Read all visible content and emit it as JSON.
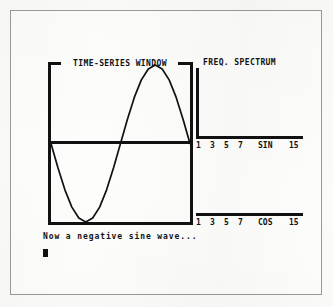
{
  "app": {
    "screen_title": "TIME-SERIES WINDOW",
    "spectrum_title": "FREQ. SPECTRUM",
    "status_message": "Now a negative sine wave...",
    "cursor": "■",
    "ink_color": "#111111",
    "paper_color": "#fdfdfc",
    "frame_color": "#9a9a9a"
  },
  "timeseries": {
    "label": "TIME-SERIES WINDOW",
    "zero_line": true,
    "border": true
  },
  "spectrum": {
    "header": "FREQ. SPECTRUM",
    "sin": {
      "axis_label": "SIN",
      "ticks": [
        "1",
        "3",
        "5",
        "7",
        "SIN",
        "15"
      ],
      "tick_positions": [
        0,
        14,
        28,
        42,
        62,
        93
      ]
    },
    "cos": {
      "axis_label": "COS",
      "ticks": [
        "1",
        "3",
        "5",
        "7",
        "COS",
        "15"
      ],
      "tick_positions": [
        0,
        14,
        28,
        42,
        62,
        93
      ]
    }
  },
  "chart_data": {
    "type": "line",
    "title": "TIME-SERIES WINDOW",
    "xlabel": "",
    "ylabel": "",
    "xlim": [
      0,
      1
    ],
    "ylim": [
      -1,
      1
    ],
    "grid": false,
    "legend": "none",
    "annotations": [
      "Now a negative sine wave..."
    ],
    "series": [
      {
        "name": "negative sine wave",
        "x": [
          0.0,
          0.05,
          0.1,
          0.15,
          0.2,
          0.25,
          0.3,
          0.35,
          0.4,
          0.45,
          0.5,
          0.55,
          0.6,
          0.65,
          0.7,
          0.75,
          0.8,
          0.85,
          0.9,
          0.95,
          1.0
        ],
        "y": [
          0.0,
          -0.31,
          -0.59,
          -0.81,
          -0.95,
          -1.0,
          -0.95,
          -0.81,
          -0.59,
          -0.31,
          0.0,
          0.31,
          0.59,
          0.81,
          0.95,
          1.0,
          0.95,
          0.81,
          0.59,
          0.31,
          0.0
        ]
      }
    ],
    "subplots": [
      {
        "type": "bar",
        "name": "sine spectrum",
        "ylabel": "SIN",
        "categories": [
          "1",
          "3",
          "5",
          "7",
          "15"
        ],
        "tick_labels": [
          "1",
          "3",
          "5",
          "7",
          "SIN",
          "15"
        ],
        "values": [
          0,
          0,
          0,
          0,
          0
        ],
        "ylim": [
          0,
          1
        ],
        "note": "vertical axis shown at left, no visible spikes"
      },
      {
        "type": "bar",
        "name": "cosine spectrum",
        "ylabel": "COS",
        "categories": [
          "1",
          "3",
          "5",
          "7",
          "15"
        ],
        "tick_labels": [
          "1",
          "3",
          "5",
          "7",
          "COS",
          "15"
        ],
        "values": [
          0,
          0,
          0,
          0,
          0
        ],
        "ylim": [
          0,
          1
        ],
        "note": "baseline only, no visible spikes"
      }
    ]
  }
}
